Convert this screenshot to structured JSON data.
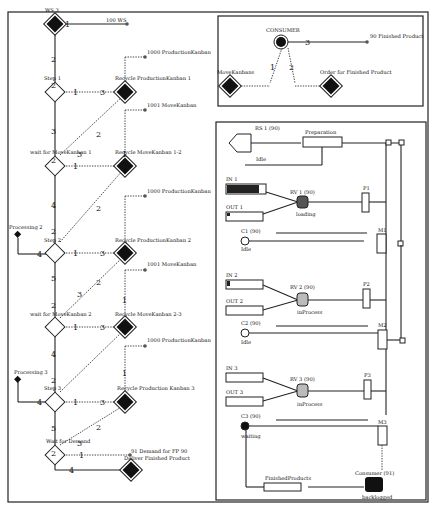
{
  "left_net": {
    "places": {
      "ws3": "WS 3",
      "ws100": "100 WS",
      "pk1000a": "1000 ProductionKanban",
      "mk1001a": "1001 MoveKanban",
      "pk1000b": "1000 ProductionKanban",
      "mk1001b": "1001 MoveKanban",
      "pk1000c": "1000 ProductionKanban",
      "demand": "91 Demand for FP 90",
      "proc2": "Processing 2",
      "proc3": "Processing 3"
    },
    "transitions": {
      "step1": "Step 1",
      "recycle_pk1": "Recycle ProductionKanban 1",
      "wait_mk1": "wait for MoveKanban 1",
      "recycle_mk12": "Recycle MoveKanban 1-2",
      "step2": "Step 2",
      "recycle_pk2": "Recycle ProductionKanban 2",
      "wait_mk2": "wait for MoveKanban 2",
      "recycle_mk23": "Recycle MoveKanban 2-3",
      "step3": "Step 3",
      "recycle_pk3": "Recycle Production Kanban 3",
      "wait_demand": "Wait for Demand",
      "deliver": "Deliver Finished Product"
    },
    "weights": [
      "1",
      "2",
      "2",
      "1",
      "3",
      "3",
      "2",
      "1",
      "3",
      "2",
      "1",
      "2",
      "4",
      "2",
      "4",
      "1",
      "3",
      "5",
      "2",
      "1",
      "3",
      "2",
      "1",
      "3",
      "4",
      "2",
      "4",
      "1",
      "3",
      "5",
      "2",
      "1",
      "3",
      "2",
      "1",
      "4"
    ]
  },
  "consumer_net": {
    "consumer": "CONSUMER",
    "fp90": "90 Finished Product",
    "move_kanbans": "MoveKanbans",
    "order_fp": "Order for Finished Product",
    "w1": "1",
    "w2": "2",
    "w3": "3"
  },
  "sim_panel": {
    "rs1": "RS 1 (90)",
    "preparation": "Preparation",
    "idle_rs": "Idle",
    "in1": "IN 1",
    "out1": "OUT 1",
    "rv1": "RV 1 (90)",
    "rv1_state": "loading",
    "p1": "P1",
    "c1": "C1 (90)",
    "c1_state": "Idle",
    "m1": "M1",
    "in2": "IN 2",
    "out2": "OUT 2",
    "rv2": "RV 2 (90)",
    "rv2_state": "inProcess",
    "p2": "P2",
    "c2": "C2 (90)",
    "c2_state": "Idle",
    "m2": "M2",
    "in3": "IN 3",
    "out3": "OUT 3",
    "rv3": "RV 3 (90)",
    "rv3_state": "inProcess",
    "p3": "P3",
    "c3": "C3 (90)",
    "c3_state": "waiting",
    "m3": "M3",
    "finished": "FinishedProducts",
    "consumer91": "Consumer (91)",
    "consumer_state": "backlogged"
  }
}
